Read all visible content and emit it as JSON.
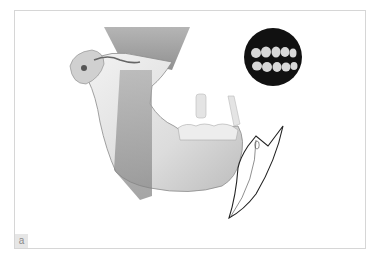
{
  "figure": {
    "panel_label": "a",
    "elements": [
      "mandible",
      "temporomandibular-joint",
      "sectional-planes",
      "occlusion-inset",
      "wedge-outline"
    ]
  },
  "colors": {
    "background": "#ffffff",
    "frame_border": "#d6d6d6",
    "bone_light": "#e8e8e8",
    "bone_shadow": "#9a9a9a",
    "plane_dark": "#8c8c8c",
    "inset_bg": "#111111",
    "outline": "#222222",
    "label_bg": "#e6e6e6"
  }
}
